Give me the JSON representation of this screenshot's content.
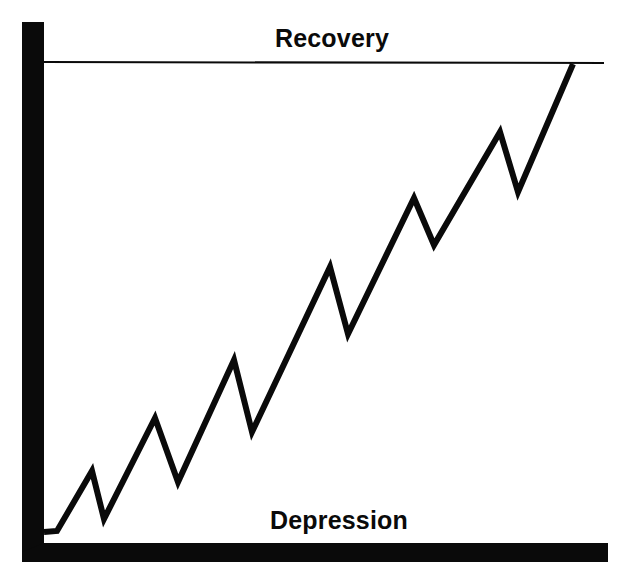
{
  "figure": {
    "background_color": "#ffffff",
    "ink_color": "#0a0a0a",
    "width": 626,
    "height": 576
  },
  "labels": {
    "recovery": "Recovery",
    "depression": "Depression"
  },
  "chart_data": {
    "type": "line",
    "title": "",
    "subtitle": "",
    "xlabel": "",
    "ylabel": "",
    "grid": false,
    "legend_position": "none",
    "xlim": [
      0,
      626
    ],
    "ylim": [
      0,
      576
    ],
    "annotations": [
      {
        "text": "Recovery",
        "role": "upper-band-label",
        "x": 299,
        "y": 40,
        "description": "Bold label above the thin horizontal ceiling line"
      },
      {
        "text": "Depression",
        "role": "lower-band-label",
        "x": 317,
        "y": 522,
        "description": "Bold label above the thick horizontal baseline axis"
      }
    ],
    "reference_lines": [
      {
        "name": "recovery-line",
        "orientation": "horizontal",
        "y": 62,
        "x_start": 44,
        "x_end": 604,
        "stroke_width": 2,
        "color": "#0a0a0a"
      }
    ],
    "axes": [
      {
        "name": "y-axis-bar",
        "orientation": "vertical",
        "x": 22,
        "y_start": 22,
        "y_end": 562,
        "thickness": 22,
        "color": "#0a0a0a"
      },
      {
        "name": "x-axis-bar",
        "orientation": "horizontal",
        "y": 543,
        "x_start": 22,
        "x_end": 608,
        "thickness": 19,
        "color": "#0a0a0a"
      }
    ],
    "series": [
      {
        "name": "business-cycle",
        "color": "#0a0a0a",
        "stroke_width": 6,
        "points": [
          {
            "x": 44,
            "y": 532,
            "kind": "start"
          },
          {
            "x": 57,
            "y": 531,
            "kind": "flat"
          },
          {
            "x": 92,
            "y": 471,
            "kind": "peak"
          },
          {
            "x": 104,
            "y": 519,
            "kind": "trough"
          },
          {
            "x": 155,
            "y": 418,
            "kind": "peak"
          },
          {
            "x": 178,
            "y": 482,
            "kind": "trough"
          },
          {
            "x": 234,
            "y": 360,
            "kind": "peak"
          },
          {
            "x": 252,
            "y": 432,
            "kind": "trough"
          },
          {
            "x": 330,
            "y": 267,
            "kind": "peak"
          },
          {
            "x": 348,
            "y": 334,
            "kind": "trough"
          },
          {
            "x": 414,
            "y": 198,
            "kind": "peak"
          },
          {
            "x": 434,
            "y": 245,
            "kind": "trough"
          },
          {
            "x": 500,
            "y": 132,
            "kind": "peak"
          },
          {
            "x": 518,
            "y": 192,
            "kind": "trough"
          },
          {
            "x": 573,
            "y": 64,
            "kind": "end"
          }
        ],
        "path": "M 44 532 L 57 531 L 92 471 L 104 519 L 155 418 L 178 482 L 234 360 L 252 432 L 330 267 L 348 334 L 414 198 L 434 245 L 500 132 L 518 192 L 573 64"
      }
    ]
  }
}
